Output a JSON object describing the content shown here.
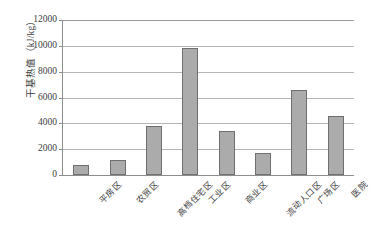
{
  "chart_data": {
    "type": "bar",
    "title": "",
    "xlabel": "",
    "ylabel": "干基热值（kJ/kg）",
    "ylim": [
      0,
      12000
    ],
    "ytick_step": 2000,
    "yticks": [
      "0",
      "2000",
      "4000",
      "6000",
      "8000",
      "10000",
      "12000"
    ],
    "grid": true,
    "legend": false,
    "bar_color": "#ababab",
    "bar_border_color": "#6f6f6f",
    "gridline_color": "#b4b4b4",
    "axis_color": "#8d8d8d",
    "categories": [
      "平房区",
      "农贸区",
      "高档住宅区",
      "工业区",
      "商业区",
      "流动人口区",
      "广场区",
      "医院"
    ],
    "values": [
      800,
      1150,
      3800,
      9800,
      3400,
      1700,
      6600,
      4600
    ]
  }
}
